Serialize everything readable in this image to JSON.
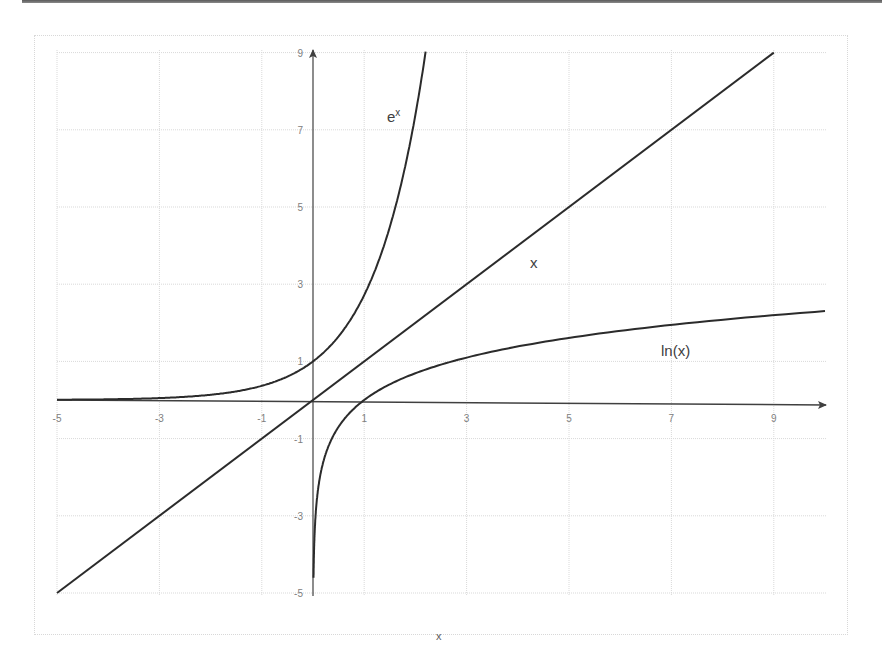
{
  "chart_data": {
    "type": "line",
    "title": "",
    "xlabel": "x",
    "ylabel": "",
    "xlim": [
      -5,
      10
    ],
    "ylim": [
      -5,
      9
    ],
    "grid": true,
    "legend": "inline labels",
    "x_ticks": [
      "-5",
      "-3",
      "-1",
      "1",
      "3",
      "5",
      "7",
      "9"
    ],
    "y_ticks": [
      "9",
      "7",
      "5",
      "3",
      "1",
      "-1",
      "-3",
      "-5"
    ],
    "series": [
      {
        "name": "e^x",
        "label": "e",
        "label_sup": "x",
        "x": [
          -5,
          -4,
          -3,
          -2,
          -1,
          0,
          0.5,
          1,
          1.5,
          2,
          2.2
        ],
        "values": [
          0.007,
          0.018,
          0.05,
          0.135,
          0.368,
          1,
          1.649,
          2.718,
          4.482,
          7.389,
          9.025
        ]
      },
      {
        "name": "x",
        "label": "x",
        "x": [
          -5,
          0,
          9
        ],
        "values": [
          -5,
          0,
          9
        ]
      },
      {
        "name": "ln(x)",
        "label": "ln(x)",
        "x": [
          0.01,
          0.1,
          0.5,
          1,
          2,
          3,
          5,
          7,
          9,
          10
        ],
        "values": [
          -4.6,
          -2.303,
          -0.693,
          0,
          0.693,
          1.099,
          1.609,
          1.946,
          2.197,
          2.303
        ]
      }
    ],
    "colors": {
      "curve": "#2b2b2b",
      "axis": "#404040",
      "grid": "#d9d9d9",
      "tick_text": "#808080"
    }
  }
}
